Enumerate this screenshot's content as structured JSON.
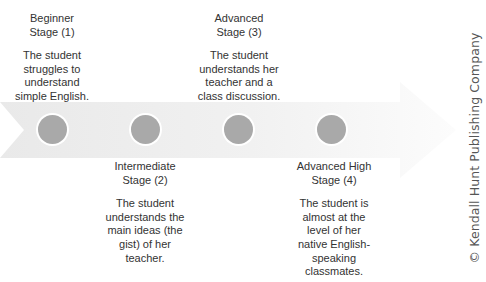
{
  "diagram": {
    "type": "timeline-arrow",
    "colors": {
      "arrow_start": "#e8e8e8",
      "arrow_end": "#fbfbfb",
      "dot": "#a9a9a9",
      "text": "#333333",
      "copyright_text": "#555555"
    },
    "stages": [
      {
        "title": "Beginner\nStage (1)",
        "description": "The student\nstruggles to\nunderstand\nsimple English.",
        "position": "above"
      },
      {
        "title": "Intermediate\nStage (2)",
        "description": "The student\nunderstands the\nmain ideas (the\ngist) of her\nteacher.",
        "position": "below"
      },
      {
        "title": "Advanced\nStage (3)",
        "description": "The student\nunderstands her\nteacher and a\nclass discussion.",
        "position": "above"
      },
      {
        "title": "Advanced High\nStage (4)",
        "description": "The student is\nalmost at the\nlevel of her\nnative English-\nspeaking\nclassmates.",
        "position": "below"
      }
    ],
    "copyright": "© Kendall Hunt Publishing Company"
  }
}
